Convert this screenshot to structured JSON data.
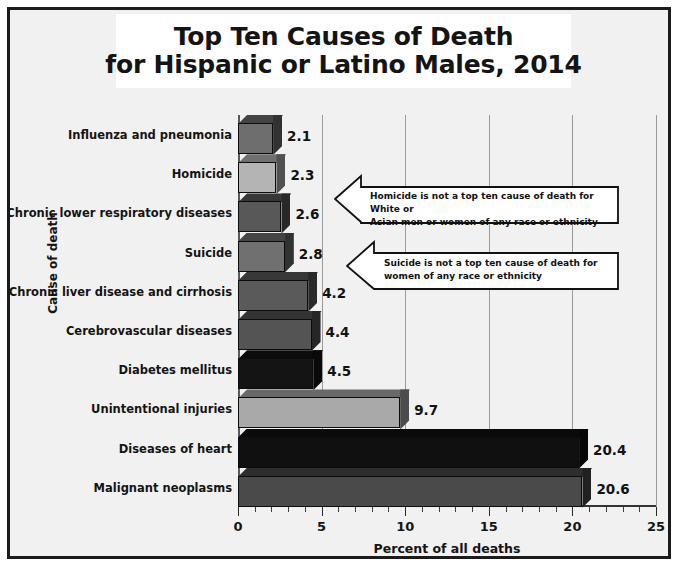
{
  "title": {
    "line1": "Top Ten Causes of Death",
    "line2": "for Hispanic or Latino Males, 2014"
  },
  "chart_data": {
    "type": "bar",
    "orientation": "horizontal",
    "title": "Top Ten Causes of Death for Hispanic or Latino Males, 2014",
    "xlabel": "Percent of all deaths",
    "ylabel": "Cause of death",
    "xlim": [
      0,
      25
    ],
    "xticks": [
      0,
      5,
      10,
      15,
      20,
      25
    ],
    "xtick_labels": [
      "0",
      "5",
      "10",
      "15",
      "20",
      "25"
    ],
    "minor_tick_step": 1,
    "grid": "vertical",
    "legend": "none",
    "categories": [
      "Influenza and pneumonia",
      "Homicide",
      "Chronic lower respiratory diseases",
      "Suicide",
      "Chronic liver disease and cirrhosis",
      "Cerebrovascular diseases",
      "Diabetes mellitus",
      "Unintentional injuries",
      "Diseases of heart",
      "Malignant neoplasms"
    ],
    "values": [
      2.1,
      2.3,
      2.6,
      2.8,
      4.2,
      4.4,
      4.5,
      9.7,
      20.4,
      20.6
    ],
    "value_labels": [
      "2.1",
      "2.3",
      "2.6",
      "2.8",
      "4.2",
      "4.4",
      "4.5",
      "9.7",
      "20.4",
      "20.6"
    ],
    "bar_colors": [
      "#6e6e6e",
      "#b4b4b4",
      "#585858",
      "#707070",
      "#5a5a5a",
      "#545454",
      "#141414",
      "#a9a9a9",
      "#101010",
      "#4a4a4a"
    ],
    "annotations": [
      {
        "id": "homicide-callout",
        "line1": "Homicide is not a top ten cause of death for White or",
        "line2": "Asian men or women of any race or ethnicity"
      },
      {
        "id": "suicide-callout",
        "line1": "Suicide is not a top ten cause of death for",
        "line2": "women of any race or ethnicity"
      }
    ]
  },
  "colors": {
    "frame_border": "#1b1b1b",
    "plot_background": "#f1f1f1",
    "title_background": "#ffffff",
    "gridline": "#9a9a9a",
    "text": "#141414"
  }
}
